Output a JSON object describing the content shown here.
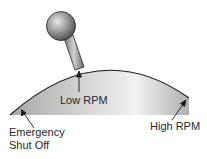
{
  "diagram": {
    "labels": {
      "low_rpm": "Low RPM",
      "high_rpm": "High RPM",
      "emergency_line1": "Emergency",
      "emergency_line2": "Shut Off"
    },
    "colors": {
      "quadrant_fill": "#c8c8c8",
      "outline": "#1a1a1a",
      "text": "#2a2a2a"
    }
  }
}
